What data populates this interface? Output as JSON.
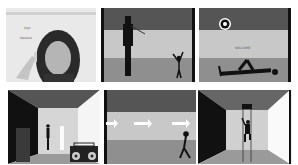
{
  "figure": {
    "layout": "2x3 grid of panels",
    "panels": [
      {
        "id": "p1",
        "description": "Webcam photo of a person pointing at the screen",
        "annotation_lines": [
          "Sign",
          "Gesture"
        ]
      },
      {
        "id": "p2",
        "description": "Rendered scene: tall shadow figure and small stick figure with raised arms"
      },
      {
        "id": "p3",
        "description": "Rendered scene: target icon on wall, text label, figure lying on floor",
        "label_text": "WELCOME",
        "icon": "target-icon"
      },
      {
        "id": "p4",
        "description": "Rendered room: dark wall, doorway, standing figure, glowing figure, boombox"
      },
      {
        "id": "p5",
        "description": "Rendered corridor with three white arrows pointing right and walking figure",
        "arrows": 3
      },
      {
        "id": "p6",
        "description": "Rendered room: figure climbing ladder through ceiling hatch"
      }
    ]
  },
  "colors": {
    "ceiling": "#555555",
    "wall": "#c8c8c8",
    "floor": "#8f8f8f",
    "dark_wall": "#111111",
    "figure": "#111111",
    "arrow": "#ffffff"
  }
}
